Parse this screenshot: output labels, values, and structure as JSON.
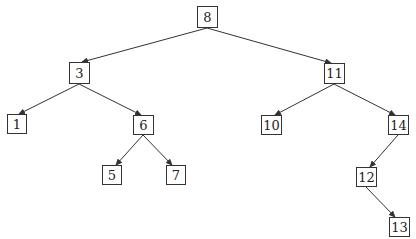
{
  "diagram": {
    "type": "binary-search-tree",
    "colors": {
      "stroke": "#333333",
      "text": "#222222",
      "background": "#ffffff"
    },
    "nodes": [
      {
        "id": "n8",
        "label": "8",
        "x": 197,
        "y": 6,
        "w": 21,
        "h": 22
      },
      {
        "id": "n3",
        "label": "3",
        "x": 69,
        "y": 62,
        "w": 21,
        "h": 22
      },
      {
        "id": "n11",
        "label": "11",
        "x": 324,
        "y": 63,
        "w": 21,
        "h": 21
      },
      {
        "id": "n1",
        "label": "1",
        "x": 7,
        "y": 114,
        "w": 20,
        "h": 20
      },
      {
        "id": "n6",
        "label": "6",
        "x": 133,
        "y": 115,
        "w": 21,
        "h": 20
      },
      {
        "id": "n10",
        "label": "10",
        "x": 261,
        "y": 115,
        "w": 21,
        "h": 20
      },
      {
        "id": "n14",
        "label": "14",
        "x": 388,
        "y": 115,
        "w": 21,
        "h": 20
      },
      {
        "id": "n5",
        "label": "5",
        "x": 102,
        "y": 165,
        "w": 20,
        "h": 20
      },
      {
        "id": "n7",
        "label": "7",
        "x": 166,
        "y": 165,
        "w": 20,
        "h": 20
      },
      {
        "id": "n12",
        "label": "12",
        "x": 356,
        "y": 167,
        "w": 21,
        "h": 20
      },
      {
        "id": "n13",
        "label": "13",
        "x": 389,
        "y": 217,
        "w": 21,
        "h": 20
      }
    ],
    "edges": [
      {
        "from": "8",
        "to": "3",
        "x1": 207,
        "y1": 28,
        "x2": 82,
        "y2": 62
      },
      {
        "from": "8",
        "to": "11",
        "x1": 207,
        "y1": 28,
        "x2": 331,
        "y2": 63
      },
      {
        "from": "3",
        "to": "1",
        "x1": 79,
        "y1": 84,
        "x2": 19,
        "y2": 114
      },
      {
        "from": "3",
        "to": "6",
        "x1": 79,
        "y1": 84,
        "x2": 141,
        "y2": 115
      },
      {
        "from": "11",
        "to": "10",
        "x1": 334,
        "y1": 84,
        "x2": 275,
        "y2": 115
      },
      {
        "from": "11",
        "to": "14",
        "x1": 334,
        "y1": 84,
        "x2": 395,
        "y2": 115
      },
      {
        "from": "6",
        "to": "5",
        "x1": 143,
        "y1": 135,
        "x2": 116,
        "y2": 165
      },
      {
        "from": "6",
        "to": "7",
        "x1": 143,
        "y1": 135,
        "x2": 172,
        "y2": 165
      },
      {
        "from": "14",
        "to": "12",
        "x1": 398,
        "y1": 135,
        "x2": 370,
        "y2": 167
      },
      {
        "from": "12",
        "to": "13",
        "x1": 366,
        "y1": 187,
        "x2": 395,
        "y2": 217
      }
    ]
  }
}
